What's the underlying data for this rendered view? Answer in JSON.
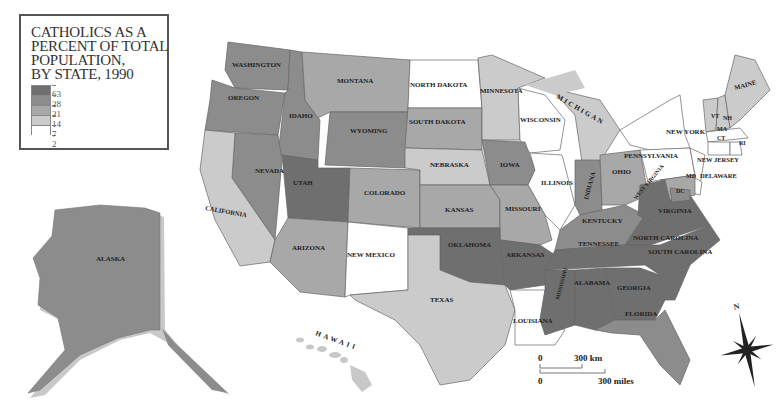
{
  "title": "CATHOLICS AS A\nPERCENT OF TOTAL\nPOPULATION,\nBY STATE, 1990",
  "legend": {
    "breaks": [
      "63",
      "28",
      "21",
      "14",
      "7",
      "2"
    ],
    "classes": [
      {
        "range": "28–63",
        "color": "#6f6f6f"
      },
      {
        "range": "21–28",
        "color": "#8c8c8c"
      },
      {
        "range": "14–21",
        "color": "#a8a8a8"
      },
      {
        "range": "7–14",
        "color": "#cbcbcb"
      },
      {
        "range": "2–7",
        "color": "#ffffff"
      }
    ]
  },
  "states": [
    {
      "label": "WASHINGTON",
      "class": 1
    },
    {
      "label": "OREGON",
      "class": 1
    },
    {
      "label": "IDAHO",
      "class": 1
    },
    {
      "label": "MONTANA",
      "class": 2
    },
    {
      "label": "WYOMING",
      "class": 1
    },
    {
      "label": "NORTH DAKOTA",
      "class": 4
    },
    {
      "label": "SOUTH DAKOTA",
      "class": 2
    },
    {
      "label": "MINNESOTA",
      "class": 3
    },
    {
      "label": "WISCONSIN",
      "class": 4
    },
    {
      "label": "MICHIGAN",
      "class": 3
    },
    {
      "label": "NEVADA",
      "class": 1
    },
    {
      "label": "UTAH",
      "class": 0
    },
    {
      "label": "COLORADO",
      "class": 2
    },
    {
      "label": "CALIFORNIA",
      "class": 3
    },
    {
      "label": "NEBRASKA",
      "class": 3
    },
    {
      "label": "IOWA",
      "class": 1
    },
    {
      "label": "ILLINOIS",
      "class": 4
    },
    {
      "label": "INDIANA",
      "class": 1
    },
    {
      "label": "OHIO",
      "class": 2
    },
    {
      "label": "KANSAS",
      "class": 2
    },
    {
      "label": "MISSOURI",
      "class": 2
    },
    {
      "label": "KENTUCKY",
      "class": 1
    },
    {
      "label": "WEST VIRGINIA",
      "class": 0
    },
    {
      "label": "VIRGINIA",
      "class": 0
    },
    {
      "label": "ARIZONA",
      "class": 2
    },
    {
      "label": "NEW MEXICO",
      "class": 4
    },
    {
      "label": "OKLAHOMA",
      "class": 0
    },
    {
      "label": "ARKANSAS",
      "class": 0
    },
    {
      "label": "TENNESSEE",
      "class": 0
    },
    {
      "label": "NORTH CAROLINA",
      "class": 0
    },
    {
      "label": "SOUTH CAROLINA",
      "class": 0
    },
    {
      "label": "MISSISSIPPI",
      "class": 0
    },
    {
      "label": "ALABAMA",
      "class": 0
    },
    {
      "label": "GEORGIA",
      "class": 0
    },
    {
      "label": "TEXAS",
      "class": 3
    },
    {
      "label": "LOUISIANA",
      "class": 4
    },
    {
      "label": "FLORIDA",
      "class": 1
    },
    {
      "label": "NEW YORK",
      "class": 4
    },
    {
      "label": "PENNSYLVANIA",
      "class": 4
    },
    {
      "label": "NEW JERSEY",
      "class": 4
    },
    {
      "label": "DELAWARE",
      "class": 4
    },
    {
      "label": "MD",
      "class": 2
    },
    {
      "label": "DC",
      "class": 1
    },
    {
      "label": "VT",
      "class": 3
    },
    {
      "label": "NH",
      "class": 3
    },
    {
      "label": "MAINE",
      "class": 3
    },
    {
      "label": "MA",
      "class": 4
    },
    {
      "label": "CT",
      "class": 4
    },
    {
      "label": "RI",
      "class": 4
    },
    {
      "label": "ALASKA",
      "class": 1
    },
    {
      "label": "HAWAII",
      "class": 3
    }
  ],
  "scale_bar": {
    "km_zero": "0",
    "km_label": "300 km",
    "mi_zero": "0",
    "mi_label": "300 miles"
  },
  "compass": {
    "north_label": "N"
  }
}
